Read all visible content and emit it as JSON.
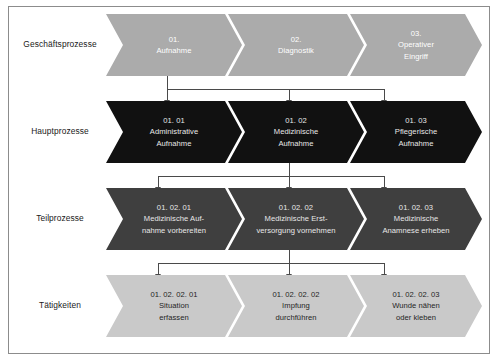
{
  "diagram": {
    "type": "process-hierarchy-chevron",
    "levels": [
      {
        "label": "Geschäftsprozesse",
        "fill": "#ababab",
        "text_color": "#ffffff",
        "items": [
          {
            "code": "01.",
            "lines": [
              "01.",
              "Aufnahme"
            ]
          },
          {
            "code": "02.",
            "lines": [
              "02.",
              "Diagnostik"
            ]
          },
          {
            "code": "03.",
            "lines": [
              "03.",
              "Operativer",
              "Eingriff"
            ]
          }
        ]
      },
      {
        "label": "Hauptprozesse",
        "fill": "#111111",
        "text_color": "#e8e8e8",
        "items": [
          {
            "code": "01. 01",
            "lines": [
              "01. 01",
              "Administrative",
              "Aufnahme"
            ]
          },
          {
            "code": "01. 02",
            "lines": [
              "01. 02",
              "Medizinische",
              "Aufnahme"
            ]
          },
          {
            "code": "01. 03",
            "lines": [
              "01. 03",
              "Pflegerische",
              "Aufnahme"
            ]
          }
        ]
      },
      {
        "label": "Teilprozesse",
        "fill": "#3f3f3f",
        "text_color": "#e8e8e8",
        "items": [
          {
            "code": "01. 02. 01",
            "lines": [
              "01. 02. 01",
              "Medizinische Auf-",
              "nahme vorbereiten"
            ]
          },
          {
            "code": "01. 02. 02",
            "lines": [
              "01. 02. 02",
              "Medizinische Erst-",
              "versorgung vornehmen"
            ]
          },
          {
            "code": "01. 02. 03",
            "lines": [
              "01. 02. 03",
              "Medizinische",
              "Anamnese erheben"
            ]
          }
        ]
      },
      {
        "label": "Tätigkeiten",
        "fill": "#c9c9c9",
        "text_color": "#1f1f1f",
        "items": [
          {
            "code": "01. 02. 02. 01",
            "lines": [
              "01. 02. 02. 01",
              "Situation",
              "erfassen"
            ]
          },
          {
            "code": "01. 02. 02. 02",
            "lines": [
              "01. 02. 02. 02",
              "Impfung",
              "durchführen"
            ]
          },
          {
            "code": "01. 02. 02. 03",
            "lines": [
              "01. 02. 02. 03",
              "Wunde nähen",
              "oder kleben"
            ]
          }
        ]
      }
    ],
    "connectors": [
      {
        "name": "connector-level1-to-level2",
        "source_index": 0,
        "targets": [
          0,
          1,
          2
        ]
      },
      {
        "name": "connector-level2-to-level3",
        "source_index": 1,
        "targets": [
          0,
          1,
          2
        ]
      },
      {
        "name": "connector-level3-to-level4",
        "source_index": 1,
        "targets": [
          0,
          1,
          2
        ]
      }
    ],
    "colors": {
      "level1_fill": "#ababab",
      "level2_fill": "#111111",
      "level3_fill": "#3f3f3f",
      "level4_fill": "#c9c9c9",
      "connector": "#4a4a4a",
      "frame": "#8c8c8c",
      "background": "#ffffff"
    }
  }
}
